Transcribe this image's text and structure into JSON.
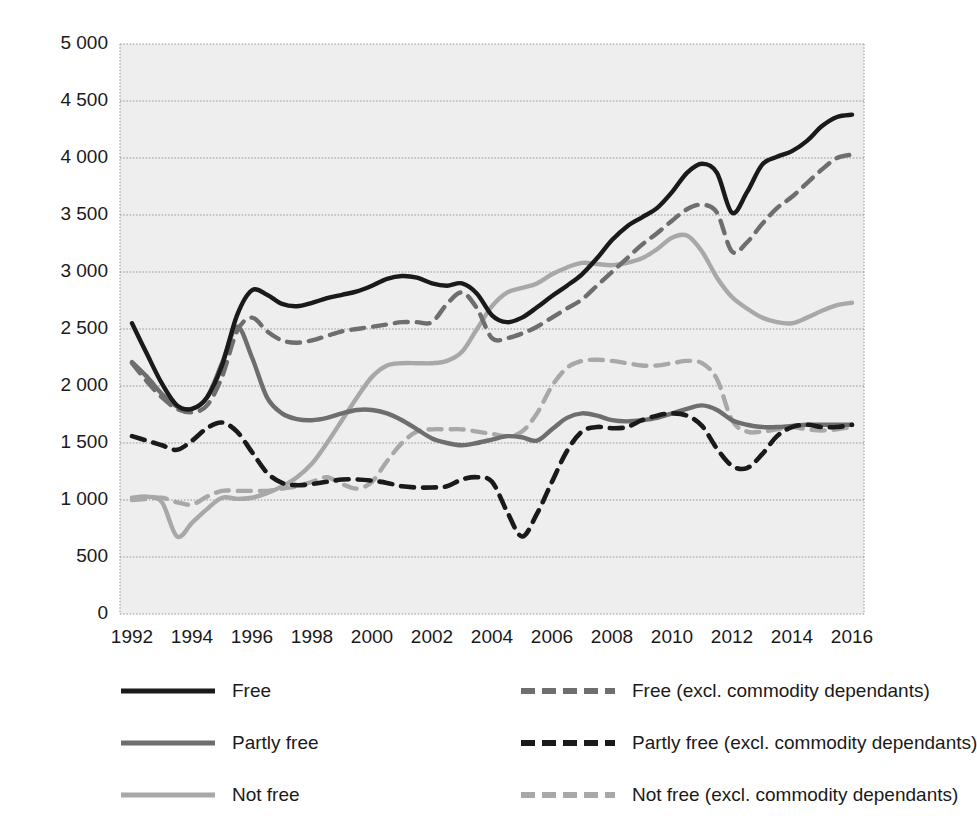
{
  "chart_data": {
    "type": "line",
    "title": "",
    "xlabel": "",
    "ylabel": "CONSTANT 2010 (US$)",
    "xlim": [
      1991.6,
      2016.4
    ],
    "ylim": [
      0,
      5000
    ],
    "grid": true,
    "legend_position": "bottom",
    "x_ticks": [
      "1992",
      "1994",
      "1996",
      "1998",
      "2000",
      "2002",
      "2004",
      "2006",
      "2008",
      "2010",
      "2012",
      "2014",
      "2016"
    ],
    "x_tick_values": [
      1992,
      1994,
      1996,
      1998,
      2000,
      2002,
      2004,
      2006,
      2008,
      2010,
      2012,
      2014,
      2016
    ],
    "y_ticks": [
      "0",
      "500",
      "1 000",
      "1 500",
      "2 000",
      "2 500",
      "3 000",
      "3 500",
      "4 000",
      "4 500",
      "5 000"
    ],
    "y_tick_values": [
      0,
      500,
      1000,
      1500,
      2000,
      2500,
      3000,
      3500,
      4000,
      4500,
      5000
    ],
    "x": [
      1992,
      1992.5,
      1993,
      1993.5,
      1994,
      1994.5,
      1995,
      1995.5,
      1996,
      1996.5,
      1997,
      1997.5,
      1998,
      1998.5,
      1999,
      1999.5,
      2000,
      2000.5,
      2001,
      2001.5,
      2002,
      2002.5,
      2003,
      2003.5,
      2004,
      2004.5,
      2005,
      2005.5,
      2006,
      2006.5,
      2007,
      2007.5,
      2008,
      2008.5,
      2009,
      2009.5,
      2010,
      2010.5,
      2011,
      2011.5,
      2012,
      2012.5,
      2013,
      2013.5,
      2014,
      2014.5,
      2015,
      2015.5,
      2016
    ],
    "series": [
      {
        "name": "Free",
        "color": "#1a1a1a",
        "style": "solid",
        "width": 4.4,
        "values": [
          2550,
          2280,
          2020,
          1830,
          1800,
          1900,
          2180,
          2620,
          2840,
          2800,
          2720,
          2700,
          2730,
          2770,
          2800,
          2830,
          2880,
          2940,
          2965,
          2950,
          2900,
          2880,
          2900,
          2810,
          2620,
          2560,
          2600,
          2690,
          2790,
          2880,
          2980,
          3120,
          3280,
          3400,
          3480,
          3560,
          3700,
          3870,
          3950,
          3870,
          3520,
          3700,
          3940,
          4010,
          4060,
          4150,
          4280,
          4360,
          4380
        ]
      },
      {
        "name": "Partly free",
        "color": "#6e6e6e",
        "style": "solid",
        "width": 4.4,
        "values": [
          2210,
          2080,
          1930,
          1820,
          1800,
          1900,
          2200,
          2520,
          2250,
          1900,
          1760,
          1710,
          1700,
          1720,
          1760,
          1790,
          1790,
          1760,
          1700,
          1620,
          1540,
          1500,
          1480,
          1500,
          1530,
          1560,
          1550,
          1520,
          1620,
          1720,
          1760,
          1740,
          1700,
          1690,
          1700,
          1720,
          1760,
          1800,
          1830,
          1790,
          1700,
          1660,
          1640,
          1640,
          1650,
          1660,
          1660,
          1660,
          1660
        ]
      },
      {
        "name": "Not free",
        "color": "#a8a8a8",
        "style": "solid",
        "width": 4.4,
        "values": [
          1020,
          1030,
          980,
          680,
          800,
          920,
          1020,
          1010,
          1020,
          1060,
          1120,
          1200,
          1320,
          1500,
          1700,
          1900,
          2080,
          2180,
          2200,
          2200,
          2200,
          2220,
          2300,
          2500,
          2700,
          2820,
          2860,
          2900,
          2980,
          3040,
          3080,
          3070,
          3060,
          3080,
          3120,
          3200,
          3300,
          3320,
          3180,
          2950,
          2780,
          2680,
          2600,
          2560,
          2550,
          2600,
          2660,
          2710,
          2730
        ]
      },
      {
        "name": "Free (excl. commodity dependants)",
        "color": "#6e6e6e",
        "style": "dashed",
        "width": 4.4,
        "values": [
          2200,
          2040,
          1900,
          1800,
          1770,
          1830,
          2080,
          2480,
          2600,
          2480,
          2400,
          2380,
          2400,
          2440,
          2480,
          2500,
          2520,
          2540,
          2560,
          2560,
          2560,
          2720,
          2820,
          2680,
          2420,
          2420,
          2460,
          2520,
          2600,
          2680,
          2760,
          2880,
          3000,
          3120,
          3240,
          3340,
          3450,
          3550,
          3590,
          3520,
          3180,
          3260,
          3420,
          3560,
          3660,
          3780,
          3900,
          4000,
          4030
        ]
      },
      {
        "name": "Partly free (excl. commodity dependants)",
        "color": "#1a1a1a",
        "style": "dashed",
        "width": 4.6,
        "values": [
          1560,
          1520,
          1480,
          1440,
          1520,
          1630,
          1680,
          1600,
          1420,
          1240,
          1150,
          1130,
          1140,
          1160,
          1180,
          1180,
          1170,
          1150,
          1120,
          1110,
          1110,
          1120,
          1180,
          1200,
          1160,
          900,
          680,
          880,
          1160,
          1430,
          1600,
          1640,
          1630,
          1640,
          1700,
          1740,
          1760,
          1740,
          1650,
          1450,
          1300,
          1280,
          1400,
          1560,
          1640,
          1660,
          1640,
          1640,
          1660
        ]
      },
      {
        "name": "Not free (excl. commodity dependants)",
        "color": "#a8a8a8",
        "style": "dashed",
        "width": 4.4,
        "values": [
          1000,
          1010,
          1020,
          980,
          960,
          1030,
          1080,
          1080,
          1080,
          1080,
          1100,
          1120,
          1160,
          1200,
          1140,
          1100,
          1160,
          1340,
          1500,
          1600,
          1620,
          1620,
          1620,
          1600,
          1580,
          1560,
          1600,
          1760,
          2000,
          2160,
          2220,
          2230,
          2220,
          2200,
          2180,
          2180,
          2200,
          2220,
          2200,
          2060,
          1700,
          1600,
          1600,
          1620,
          1640,
          1620,
          1610,
          1620,
          1640
        ]
      }
    ]
  },
  "legend": {
    "items": [
      {
        "label": "Free",
        "style": "solid",
        "color": "#1a1a1a"
      },
      {
        "label": "Free (excl. commodity dependants)",
        "style": "dashed",
        "color": "#6e6e6e"
      },
      {
        "label": "Partly free",
        "style": "solid",
        "color": "#6e6e6e"
      },
      {
        "label": "Partly free (excl. commodity dependants)",
        "style": "dashed",
        "color": "#1a1a1a"
      },
      {
        "label": "Not free",
        "style": "solid",
        "color": "#a8a8a8"
      },
      {
        "label": "Not free (excl. commodity dependants)",
        "style": "dashed",
        "color": "#a8a8a8"
      }
    ]
  },
  "colors": {
    "free": "#1a1a1a",
    "partly_free": "#6e6e6e",
    "not_free": "#a8a8a8",
    "plot_background": "#eeeeee",
    "gridline": "#9a9a9a",
    "page_background": "#ffffff"
  }
}
